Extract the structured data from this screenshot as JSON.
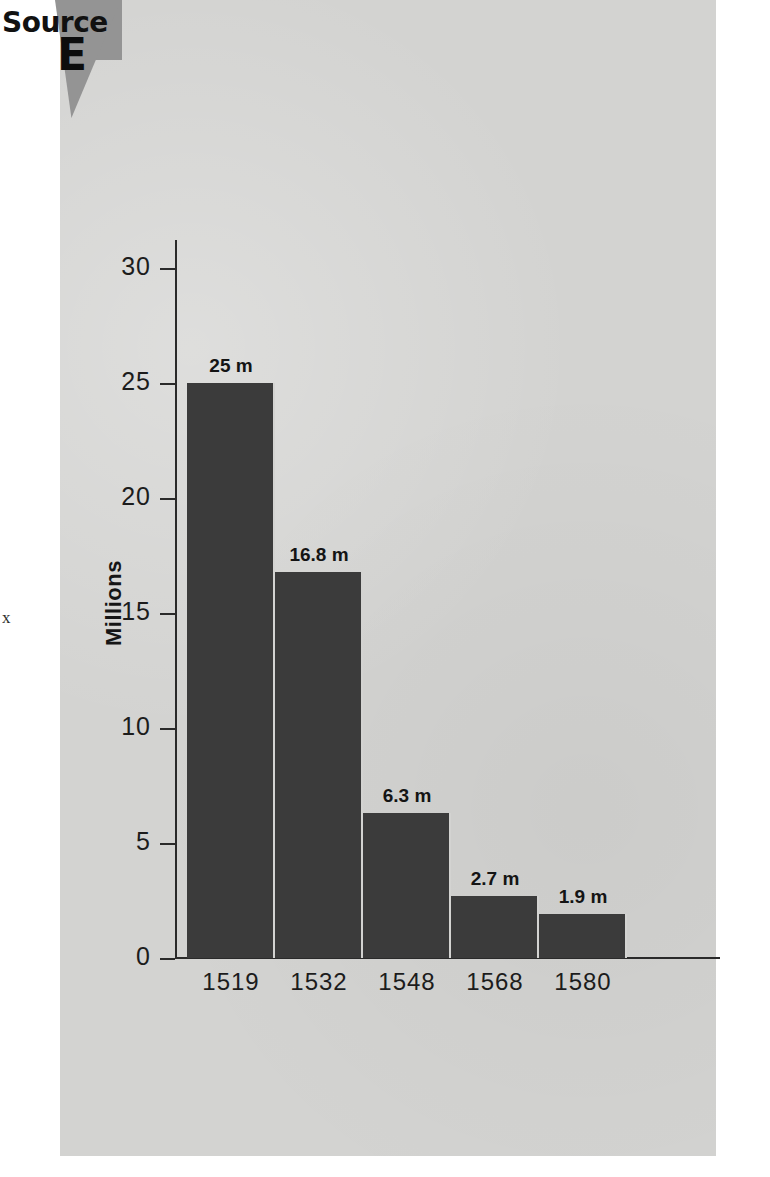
{
  "source_badge": {
    "word": "Source",
    "letter": "E",
    "wedge_color": "#949494"
  },
  "page": {
    "background": "#ffffff",
    "panel_color": "#d3d3d1",
    "artifact_glyph": "x"
  },
  "chart_data": {
    "type": "bar",
    "title": "",
    "xlabel": "",
    "ylabel": "Millions",
    "categories": [
      "1519",
      "1532",
      "1548",
      "1568",
      "1580"
    ],
    "values": [
      25,
      16.8,
      6.3,
      2.7,
      1.9
    ],
    "value_labels": [
      "25 m",
      "16.8 m",
      "6.3 m",
      "2.7 m",
      "1.9 m"
    ],
    "ylim": [
      0,
      32
    ],
    "yticks": [
      0,
      5,
      10,
      15,
      20,
      25,
      30
    ],
    "ytick_labels": [
      "0",
      "5",
      "10",
      "15",
      "20",
      "25",
      "30"
    ],
    "grid": false,
    "legend": false,
    "bar_color": "#3b3b3b",
    "axis_color": "#2a2a2a"
  }
}
